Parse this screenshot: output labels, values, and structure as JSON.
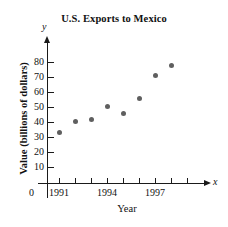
{
  "chart_data": {
    "type": "scatter",
    "title": "U.S. Exports to Mexico",
    "xlabel": "Year",
    "ylabel": "Value (billions of dollars)",
    "x": [
      1991,
      1992,
      1993,
      1994,
      1995,
      1996,
      1997,
      1998
    ],
    "values": [
      33,
      40.5,
      41.5,
      50.5,
      46,
      56,
      71,
      78
    ],
    "series": [
      {
        "name": "U.S. Exports to Mexico",
        "points": [
          {
            "x": 1991,
            "y": 33
          },
          {
            "x": 1992,
            "y": 40.5
          },
          {
            "x": 1993,
            "y": 41.5
          },
          {
            "x": 1994,
            "y": 50.5
          },
          {
            "x": 1995,
            "y": 46
          },
          {
            "x": 1996,
            "y": 56
          },
          {
            "x": 1997,
            "y": 71
          },
          {
            "x": 1998,
            "y": 78
          }
        ]
      }
    ],
    "xlim": [
      1990.3,
      1999.5
    ],
    "ylim": [
      0,
      85
    ],
    "xticks": [
      1991,
      1992,
      1993,
      1994,
      1995,
      1996,
      1997,
      1998,
      1999
    ],
    "xtick_labels": [
      "1991",
      "",
      "",
      "1994",
      "",
      "",
      "1997",
      "",
      ""
    ],
    "yticks": [
      10,
      20,
      30,
      40,
      50,
      60,
      70,
      80
    ],
    "ytick_labels": [
      "10",
      "20",
      "30",
      "40",
      "50",
      "60",
      "70",
      "80"
    ],
    "origin_label": "0",
    "x_axis_letter": "x",
    "y_axis_letter": "y",
    "grid": false,
    "legend": false,
    "marker_color": "#5f5f5f",
    "axis_color": "#1a1a1a"
  }
}
